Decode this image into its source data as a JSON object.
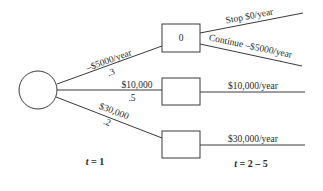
{
  "diagram": {
    "type": "decision-tree",
    "chance_node": {
      "shape": "circle"
    },
    "branches": [
      {
        "id": "low",
        "value_label": "–$5000/year",
        "probability": ".3",
        "node_label": "0"
      },
      {
        "id": "mid",
        "value_label": "$10,000",
        "probability": ".5",
        "node_label": ""
      },
      {
        "id": "high",
        "value_label": "$30,000",
        "probability": ".2",
        "node_label": ""
      }
    ],
    "outcomes": {
      "low_stop": "Stop $0/year",
      "low_continue": "Continue –$5000/year",
      "mid": "$10,000/year",
      "high": "$30,000/year"
    },
    "time_labels": {
      "t1": {
        "var": "t",
        "rest": " = 1"
      },
      "t25": {
        "var": "t",
        "rest": " = 2 – 5"
      }
    }
  }
}
